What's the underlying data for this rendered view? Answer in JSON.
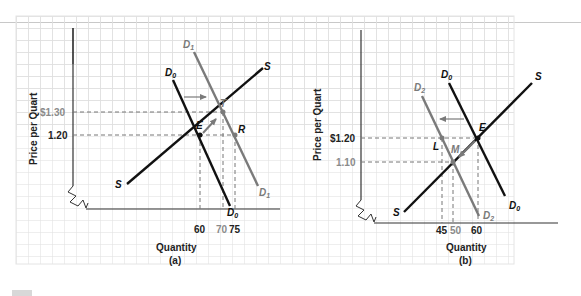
{
  "panel_a": {
    "caption": "(a)",
    "xlabel": "Quantity",
    "ylabel": "Price per Quart",
    "price_high": "$1.30",
    "price_base": "1.20",
    "q_labels": [
      "60",
      "70",
      "75"
    ],
    "curve_labels": {
      "supply_top": "S",
      "supply_bottom": "S",
      "d0_top": "D",
      "d0_top_sub": "0",
      "d0_bottom": "D",
      "d0_bottom_sub": "0",
      "d1_top": "D",
      "d1_top_sub": "1",
      "d1_bottom": "D",
      "d1_bottom_sub": "1"
    },
    "points": {
      "E": "E",
      "T": "T",
      "R": "R"
    }
  },
  "panel_b": {
    "caption": "(b)",
    "xlabel": "Quantity",
    "ylabel": "Price per Quart",
    "price_base": "$1.20",
    "price_low": "1.10",
    "q_labels": [
      "45",
      "50",
      "60"
    ],
    "curve_labels": {
      "supply_top": "S",
      "supply_bottom": "S",
      "d0_top": "D",
      "d0_top_sub": "0",
      "d0_bottom": "D",
      "d0_bottom_sub": "0",
      "d2_top": "D",
      "d2_top_sub": "2",
      "d2_bottom": "D",
      "d2_bottom_sub": "2"
    },
    "points": {
      "E": "E",
      "L": "L",
      "M": "M"
    }
  },
  "colors": {
    "black_curve": "#111111",
    "gray_curve": "#7a7a7a",
    "grid": "#dcdcdc",
    "gray_text": "#8a8a8a"
  }
}
